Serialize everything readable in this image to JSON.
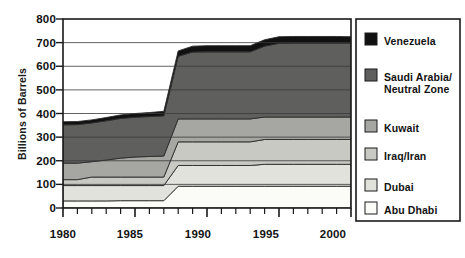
{
  "chart_data": {
    "type": "area",
    "stacked": true,
    "title": "",
    "subtitle": "",
    "xlabel": "",
    "ylabel": "Billions of Barrels",
    "xlim": [
      1980,
      2000
    ],
    "ylim": [
      0,
      800
    ],
    "xtick_labels": [
      "1980",
      "1985",
      "1990",
      "1995",
      "2000"
    ],
    "xtick_values": [
      1980,
      1985,
      1990,
      1995,
      2000
    ],
    "minor_tick_interval": 1,
    "ytick_labels": [
      "0",
      "100",
      "200",
      "300",
      "400",
      "500",
      "600",
      "700",
      "800"
    ],
    "ytick_values": [
      0,
      100,
      200,
      300,
      400,
      500,
      600,
      700,
      800
    ],
    "grid": "horizontal",
    "legend_position": "right",
    "x": [
      1980,
      1981,
      1982,
      1983,
      1984,
      1985,
      1986,
      1987,
      1988,
      1989,
      1990,
      1991,
      1992,
      1993,
      1994,
      1995,
      1996,
      1997,
      1998,
      1999,
      2000
    ],
    "series": [
      {
        "name": "Abu Dhabi",
        "color": "#fbfbf8",
        "values": [
          30,
          30,
          30,
          30,
          31,
          31,
          31,
          31,
          92,
          92,
          92,
          92,
          92,
          92,
          92,
          92,
          92,
          92,
          92,
          92,
          92
        ]
      },
      {
        "name": "Dubai",
        "color": "#e2e2dd",
        "values": [
          65,
          65,
          65,
          65,
          64,
          64,
          64,
          64,
          88,
          88,
          88,
          88,
          88,
          88,
          93,
          93,
          93,
          93,
          93,
          93,
          93
        ]
      },
      {
        "name": "Iraq/Iran",
        "color": "#c9c9c4",
        "values": [
          25,
          25,
          36,
          36,
          36,
          36,
          36,
          36,
          100,
          100,
          100,
          100,
          100,
          100,
          105,
          105,
          105,
          105,
          105,
          105,
          105
        ]
      },
      {
        "name": "Kuwait",
        "color": "#a6a6a2",
        "values": [
          70,
          70,
          65,
          72,
          80,
          85,
          87,
          89,
          97,
          97,
          97,
          97,
          97,
          97,
          95,
          95,
          95,
          95,
          95,
          95,
          95
        ]
      },
      {
        "name": "Saudi Arabia/\nNeutral Zone",
        "color": "#5f5f5e",
        "values": [
          162,
          163,
          164,
          166,
          168,
          168,
          169,
          170,
          265,
          283,
          284,
          284,
          284,
          284,
          300,
          312,
          313,
          313,
          313,
          313,
          313
        ]
      },
      {
        "name": "Venezuela",
        "color": "#111111",
        "values": [
          13,
          13,
          13,
          14,
          15,
          16,
          17,
          19,
          23,
          25,
          26,
          26,
          26,
          26,
          27,
          28,
          28,
          28,
          28,
          28,
          27
        ]
      }
    ],
    "legend_entries": [
      {
        "label": "Venezuela",
        "color": "#111111"
      },
      {
        "label": "Saudi Arabia/\nNeutral Zone",
        "color": "#5f5f5e"
      },
      {
        "label": "Kuwait",
        "color": "#a6a6a2"
      },
      {
        "label": "Iraq/Iran",
        "color": "#c9c9c4"
      },
      {
        "label": "Dubai",
        "color": "#e2e2dd"
      },
      {
        "label": "Abu Dhabi",
        "color": "#fbfbf8"
      }
    ],
    "totals_note": {
      "1980": 365,
      "1987": 409,
      "1988": 665,
      "1990": 687,
      "1995": 725,
      "2000": 725
    }
  }
}
